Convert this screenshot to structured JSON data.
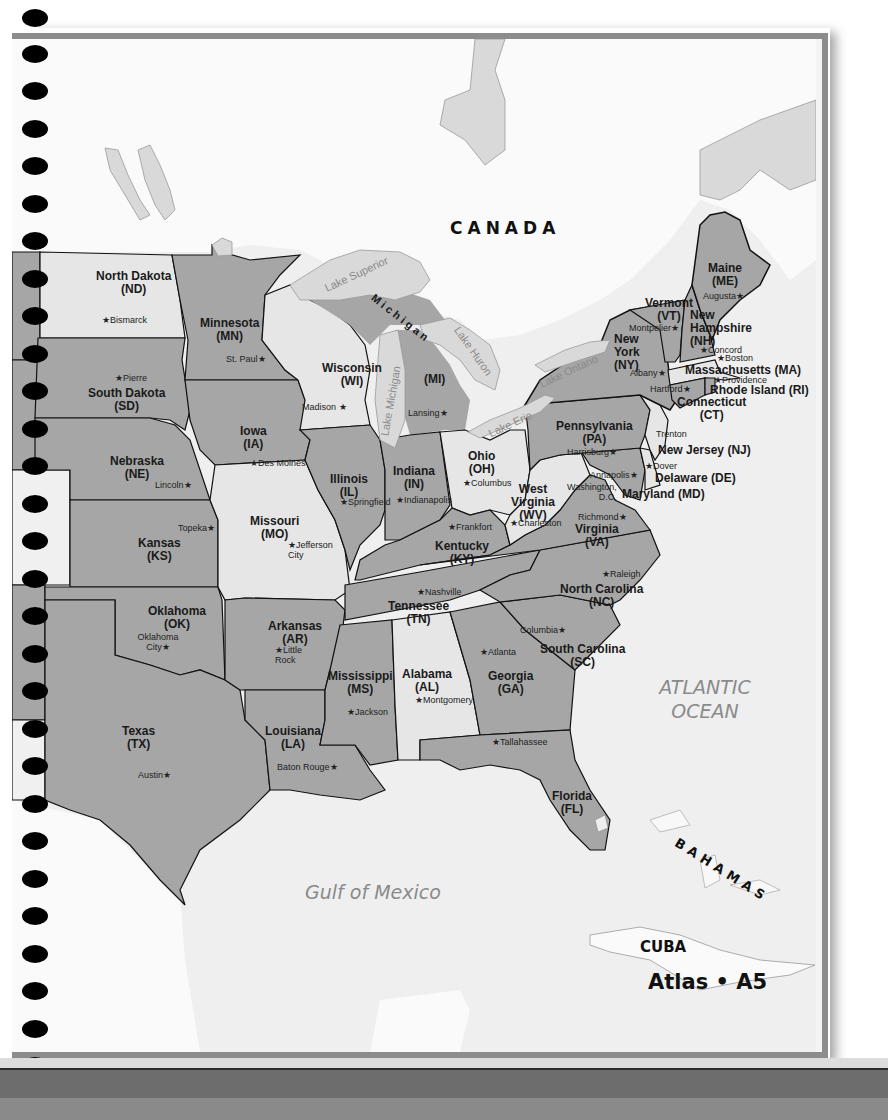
{
  "page": {
    "footer_label": "Atlas • A5"
  },
  "colors": {
    "state_dark": "#a6a6a6",
    "state_light": "#e6e6e6",
    "water": "#eeeeee",
    "land_foreign": "#f9f9f9",
    "lake": "#d9d9d9",
    "border": "#111111"
  },
  "regions": {
    "canada": "CANADA",
    "cuba": "CUBA",
    "bahamas": "BAHAMAS",
    "atlantic_line1": "ATLANTIC",
    "atlantic_line2": "OCEAN",
    "gulf": "Gulf of Mexico"
  },
  "lakes": {
    "superior": "Lake Superior",
    "michigan": "Lake Michigan",
    "huron": "Lake Huron",
    "erie": "Lake Erie",
    "ontario": "Lake Ontario"
  },
  "michigan_arc": "Michigan",
  "states": [
    {
      "name": "North Dakota",
      "abbr": "(ND)",
      "capital": "Bismarck"
    },
    {
      "name": "South Dakota",
      "abbr": "(SD)",
      "capital": "Pierre"
    },
    {
      "name": "Nebraska",
      "abbr": "(NE)",
      "capital": "Lincoln"
    },
    {
      "name": "Kansas",
      "abbr": "(KS)",
      "capital": "Topeka"
    },
    {
      "name": "Oklahoma",
      "abbr": "(OK)",
      "capital": "Oklahoma City"
    },
    {
      "name": "Texas",
      "abbr": "(TX)",
      "capital": "Austin"
    },
    {
      "name": "Minnesota",
      "abbr": "(MN)",
      "capital": "St. Paul"
    },
    {
      "name": "Iowa",
      "abbr": "(IA)",
      "capital": "Des Moines"
    },
    {
      "name": "Missouri",
      "abbr": "(MO)",
      "capital": "Jefferson City"
    },
    {
      "name": "Arkansas",
      "abbr": "(AR)",
      "capital": "Little Rock"
    },
    {
      "name": "Louisiana",
      "abbr": "(LA)",
      "capital": "Baton Rouge"
    },
    {
      "name": "Wisconsin",
      "abbr": "(WI)",
      "capital": "Madison"
    },
    {
      "name": "Illinois",
      "abbr": "(IL)",
      "capital": "Springfield"
    },
    {
      "name": "Mississippi",
      "abbr": "(MS)",
      "capital": "Jackson"
    },
    {
      "name": "Michigan",
      "abbr": "(MI)",
      "capital": "Lansing"
    },
    {
      "name": "Indiana",
      "abbr": "(IN)",
      "capital": "Indianapolis"
    },
    {
      "name": "Kentucky",
      "abbr": "(KY)",
      "capital": "Frankfort"
    },
    {
      "name": "Tennessee",
      "abbr": "(TN)",
      "capital": "Nashville"
    },
    {
      "name": "Alabama",
      "abbr": "(AL)",
      "capital": "Montgomery"
    },
    {
      "name": "Ohio",
      "abbr": "(OH)",
      "capital": "Columbus"
    },
    {
      "name": "West Virginia",
      "abbr": "(WV)",
      "capital": "Charleston"
    },
    {
      "name": "Georgia",
      "abbr": "(GA)",
      "capital": "Atlanta"
    },
    {
      "name": "Florida",
      "abbr": "(FL)",
      "capital": "Tallahassee"
    },
    {
      "name": "South Carolina",
      "abbr": "(SC)",
      "capital": "Columbia"
    },
    {
      "name": "North Carolina",
      "abbr": "(NC)",
      "capital": "Raleigh"
    },
    {
      "name": "Virginia",
      "abbr": "(VA)",
      "capital": "Richmond"
    },
    {
      "name": "Pennsylvania",
      "abbr": "(PA)",
      "capital": "Harrisburg"
    },
    {
      "name": "New York",
      "abbr": "(NY)",
      "capital": "Albany"
    },
    {
      "name": "Vermont",
      "abbr": "(VT)",
      "capital": "Montpelier"
    },
    {
      "name": "New Hampshire",
      "abbr": "(NH)",
      "capital": "Concord"
    },
    {
      "name": "Maine",
      "abbr": "(ME)",
      "capital": "Augusta"
    },
    {
      "name": "Massachusetts",
      "abbr": "(MA)",
      "capital": "Boston"
    },
    {
      "name": "Rhode Island",
      "abbr": "(RI)",
      "capital": "Providence"
    },
    {
      "name": "Connecticut",
      "abbr": "(CT)",
      "capital": "Hartford"
    },
    {
      "name": "New Jersey",
      "abbr": "(NJ)",
      "capital": "Trenton"
    },
    {
      "name": "Delaware",
      "abbr": "(DE)",
      "capital": "Dover"
    },
    {
      "name": "Maryland",
      "abbr": "(MD)",
      "capital": "Annapolis"
    }
  ],
  "district": {
    "name": "Washington,",
    "line2": "D.C."
  }
}
